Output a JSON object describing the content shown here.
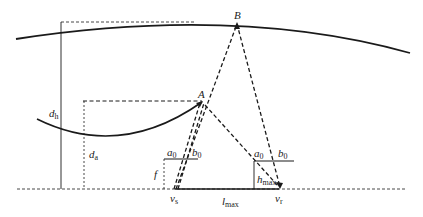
{
  "diagram": {
    "type": "geometry-schematic",
    "labels": {
      "B": "B",
      "A": "A",
      "d_h": "d",
      "d_h_sub": "h",
      "d_a": "d",
      "d_a_sub": "a",
      "f": "f",
      "a0_left": "a",
      "a0_left_sub": "0",
      "b0_left": "b",
      "b0_left_sub": "0",
      "a0_right": "a",
      "a0_right_sub": "0",
      "b0_right": "b",
      "b0_right_sub": "0",
      "h_max": "h",
      "h_max_sub": "max",
      "v_s": "v",
      "v_s_sub": "s",
      "v_r": "v",
      "v_r_sub": "r",
      "l_max": "l",
      "l_max_sub": "max"
    },
    "colors": {
      "stroke": "#1a1a1a",
      "background": "#ffffff"
    }
  }
}
